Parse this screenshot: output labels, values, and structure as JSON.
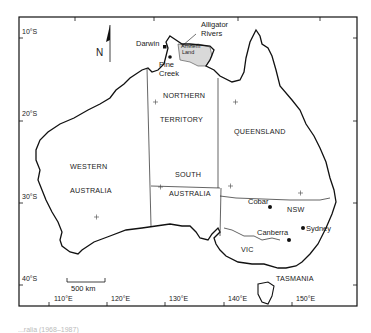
{
  "map": {
    "title": "Australia",
    "north_arrow_label": "N",
    "scale_bar_label": "500 km",
    "latitude_ticks": [
      "10°S",
      "20°S",
      "30°S",
      "40°S"
    ],
    "longitude_ticks": [
      "110°E",
      "120°E",
      "130°E",
      "140°E",
      "150°E"
    ],
    "states": [
      {
        "id": "wa",
        "lines": [
          "WESTERN",
          "AUSTRALIA"
        ]
      },
      {
        "id": "nt",
        "lines": [
          "NORTHERN",
          "TERRITORY"
        ]
      },
      {
        "id": "qld",
        "lines": [
          "QUEENSLAND"
        ]
      },
      {
        "id": "sa",
        "lines": [
          "SOUTH",
          "AUSTRALIA"
        ]
      },
      {
        "id": "nsw",
        "lines": [
          "NSW"
        ]
      },
      {
        "id": "vic",
        "lines": [
          "VIC"
        ]
      },
      {
        "id": "tas",
        "lines": [
          "TASMANIA"
        ]
      }
    ],
    "places": [
      {
        "name": "Darwin",
        "marker": "square"
      },
      {
        "name": "Pine Creek",
        "lines": [
          "Pine",
          "Creek"
        ],
        "marker": "dot"
      },
      {
        "name": "Alligator Rivers",
        "lines": [
          "Alligator",
          "Rivers"
        ],
        "marker": "leader-line"
      },
      {
        "name": "Arnhem Land",
        "lines": [
          "Arnhem",
          "Land"
        ],
        "marker": "shaded-region"
      },
      {
        "name": "Cobar",
        "marker": "dot"
      },
      {
        "name": "Canberra",
        "marker": "dot"
      },
      {
        "name": "Sydney",
        "marker": "dot"
      }
    ],
    "colors": {
      "line": "#111111",
      "shaded_region": "#d9d9d9",
      "background": "#ffffff"
    }
  },
  "caption": "...ralia (1968–1987)"
}
